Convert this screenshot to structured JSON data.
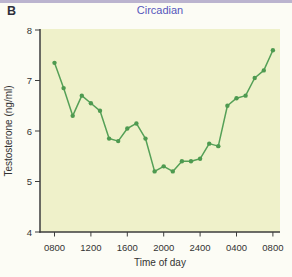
{
  "figure": {
    "panel_label": "B"
  },
  "colors": {
    "plot_bg": "#eff1ca",
    "line": "#55a057",
    "marker": "#4e9a50",
    "axis": "#3d3d3d",
    "tick_text": "#333333",
    "title_text": "#5556bc",
    "page_bg": "#fcfcf5",
    "top_strip": "#a59cc2"
  },
  "chart_data": {
    "type": "line",
    "title": "Circadian",
    "xlabel": "Time of day",
    "ylabel": "Testosterone (ng/ml)",
    "x_tick_labels": [
      "0800",
      "1200",
      "1600",
      "2000",
      "2400",
      "0400",
      "0800"
    ],
    "x_tick_hours": [
      0,
      4,
      8,
      12,
      16,
      20,
      24
    ],
    "y_ticks": [
      4,
      5,
      6,
      7,
      8
    ],
    "ylim": [
      4,
      8
    ],
    "xlim_hours": [
      0,
      24
    ],
    "grid": false,
    "legend": "none",
    "marker": "circle",
    "series": [
      {
        "name": "Testosterone",
        "x_hours": [
          0,
          1,
          2,
          3,
          4,
          5,
          6,
          7,
          8,
          9,
          10,
          11,
          12,
          13,
          14,
          15,
          16,
          17,
          18,
          19,
          20,
          21,
          22,
          23,
          24
        ],
        "x_times": [
          "0800",
          "0900",
          "1000",
          "1100",
          "1200",
          "1300",
          "1400",
          "1500",
          "1600",
          "1700",
          "1800",
          "1900",
          "2000",
          "2100",
          "2200",
          "2300",
          "2400",
          "0100",
          "0200",
          "0300",
          "0400",
          "0500",
          "0600",
          "0700",
          "0800"
        ],
        "values": [
          7.35,
          6.85,
          6.3,
          6.7,
          6.55,
          6.4,
          5.85,
          5.8,
          6.05,
          6.15,
          5.85,
          5.2,
          5.3,
          5.2,
          5.4,
          5.4,
          5.45,
          5.75,
          5.7,
          6.5,
          6.65,
          6.7,
          7.05,
          7.2,
          7.6
        ]
      }
    ]
  }
}
